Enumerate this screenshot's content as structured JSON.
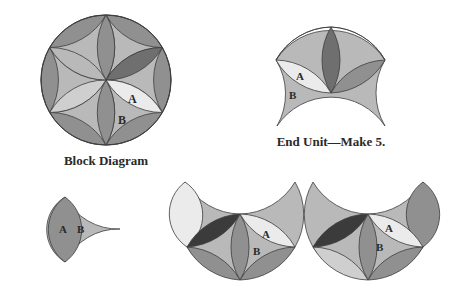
{
  "figure": {
    "block_diagram": {
      "caption": "Block Diagram",
      "label_a": "A",
      "label_b": "B"
    },
    "end_unit": {
      "caption": "End Unit—Make 5.",
      "label_a": "A",
      "label_b": "B"
    },
    "piece_unit": {
      "label_a": "A",
      "label_b": "B"
    },
    "assembly_left": {
      "label_a": "A",
      "label_b": "B"
    },
    "assembly_right": {
      "label_a": "A",
      "label_b": "B"
    }
  },
  "colors": {
    "dark": "#3b3b3b",
    "mid_dark": "#6f6f6f",
    "mid": "#909090",
    "light": "#b9b9b9",
    "lighter": "#cfcfcf",
    "lightest": "#ebebeb",
    "outline": "#3c3c3c"
  }
}
